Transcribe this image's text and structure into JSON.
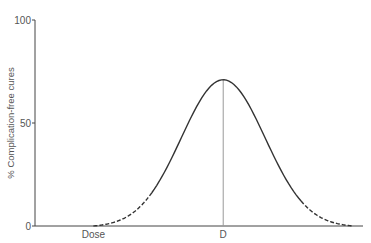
{
  "chart_data": {
    "type": "line",
    "title": "",
    "xlabel": "Dose",
    "ylabel": "% Complication-free cures",
    "ylim": [
      0,
      100
    ],
    "yticks": [
      {
        "value": 0,
        "label": "0"
      },
      {
        "value": 50,
        "label": "50"
      },
      {
        "value": 100,
        "label": "100"
      }
    ],
    "xlim": [
      0,
      100
    ],
    "x_markers": [
      {
        "name": "optimal-dose",
        "value": 58,
        "label": "D"
      }
    ],
    "series": [
      {
        "name": "complication-free-cures",
        "description": "Bell-shaped curve peaking at dose D; tails drawn dashed",
        "peak_x": 58,
        "peak_y": 71,
        "start_x": 18,
        "end_x": 98,
        "solid_from_x": 36,
        "solid_to_x": 82,
        "color": "#333333"
      }
    ],
    "grid": false,
    "legend": "none"
  }
}
